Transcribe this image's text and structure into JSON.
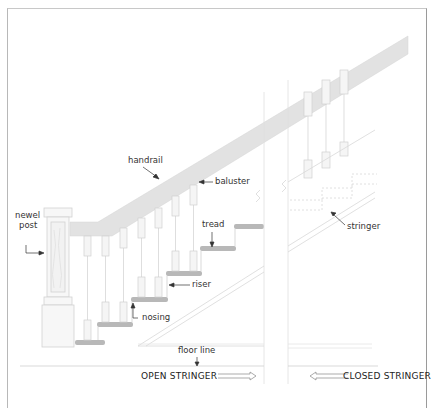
{
  "diagram": {
    "type": "staircase-anatomy",
    "labels": {
      "handrail": "handrail",
      "baluster": "baluster",
      "newel_post_line1": "newel",
      "newel_post_line2": "post",
      "tread": "tread",
      "riser": "riser",
      "nosing": "nosing",
      "stringer": "stringer",
      "floor_line": "floor line"
    },
    "captions": {
      "open_stringer": "OPEN STRINGER",
      "closed_stringer": "CLOSED STRINGER"
    },
    "colors": {
      "tread": "#b8b8b8",
      "handrail": "#e2e2e2",
      "outline": "#cfcfcf",
      "text": "#333333",
      "frame": "#a0a0a0"
    }
  }
}
